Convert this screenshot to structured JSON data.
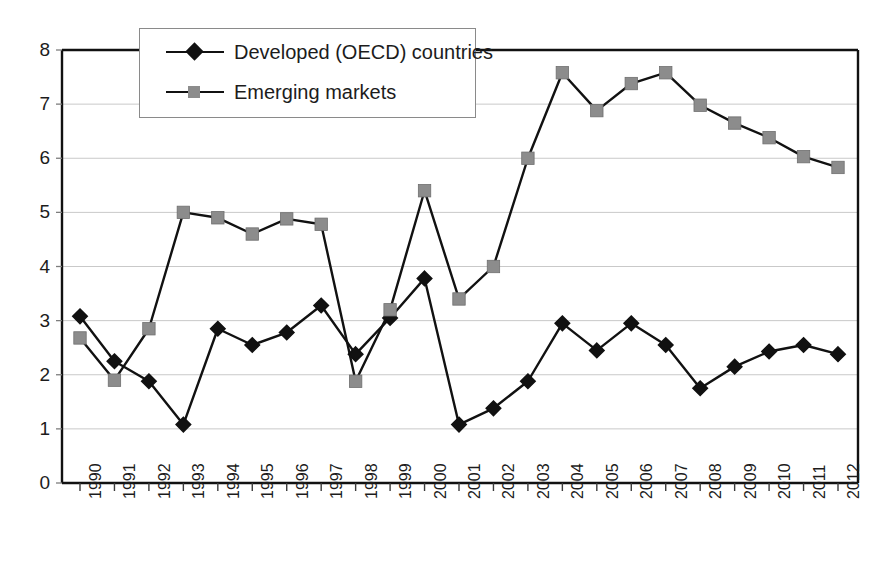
{
  "chart_data": {
    "type": "line",
    "title": "",
    "subtitle": "",
    "xlabel": "",
    "ylabel": "",
    "xlim": [
      1990,
      2012
    ],
    "ylim": [
      0,
      8
    ],
    "ytick_step": 1,
    "grid": true,
    "legend_position": "top-left-inside",
    "categories": [
      "1990",
      "1991",
      "1992",
      "1993",
      "1994",
      "1995",
      "1996",
      "1997",
      "1998",
      "1999",
      "2000",
      "2001",
      "2002",
      "2003",
      "2004",
      "2005",
      "2006",
      "2007",
      "2008",
      "2009",
      "2010",
      "2011",
      "2012"
    ],
    "yticks": [
      "0",
      "1",
      "2",
      "3",
      "4",
      "5",
      "6",
      "7",
      "8"
    ],
    "series": [
      {
        "name": "Developed (OECD) countries",
        "marker": "diamond",
        "color": "#111111",
        "values": [
          3.08,
          2.25,
          1.88,
          1.08,
          2.85,
          2.55,
          2.78,
          3.28,
          2.38,
          3.05,
          3.78,
          1.08,
          1.38,
          1.88,
          2.95,
          2.45,
          2.95,
          2.55,
          1.75,
          2.15,
          2.43,
          2.55,
          2.38
        ]
      },
      {
        "name": "Emerging markets",
        "marker": "square",
        "color": "#8c8c8c",
        "values": [
          2.68,
          1.9,
          2.85,
          5.0,
          4.9,
          4.6,
          4.88,
          4.78,
          1.88,
          3.2,
          5.4,
          3.4,
          4.0,
          6.0,
          7.58,
          6.88,
          7.38,
          7.58,
          6.98,
          6.65,
          6.38,
          6.03,
          5.83
        ]
      }
    ]
  },
  "legend": {
    "items": [
      {
        "label": "Developed (OECD) countries",
        "marker": "diamond",
        "color": "#111111"
      },
      {
        "label": "Emerging markets",
        "marker": "square",
        "color": "#8c8c8c"
      }
    ]
  },
  "colors": {
    "oecd": "#111111",
    "emerging": "#8c8c8c",
    "grid": "#c9c9c9",
    "axis": "#111111",
    "background": "#ffffff"
  }
}
